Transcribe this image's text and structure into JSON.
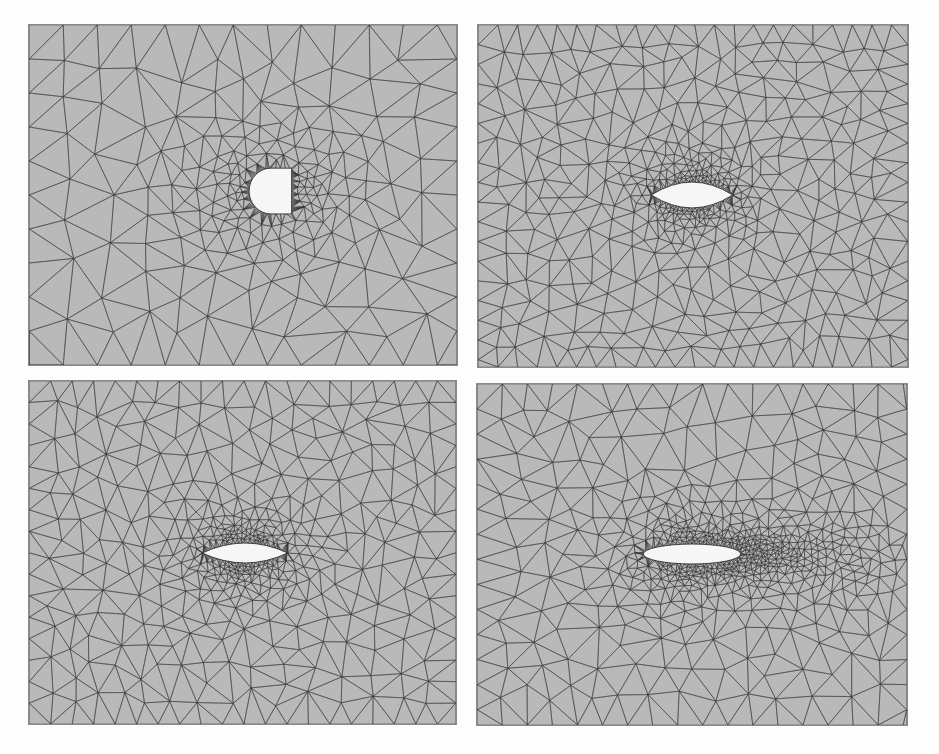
{
  "figure": {
    "background": "#fdfdfd",
    "mesh_fill": "#b9b9b9",
    "edge_color": "#3a3a3a",
    "obstacle_fill": "#f6f6f6",
    "panels": [
      {
        "id": "top-left",
        "obstacle": "d-shape",
        "x": 28,
        "y": 24,
        "w": 430,
        "h": 342,
        "cx": 243,
        "cy": 167,
        "ow": 44,
        "oh": 46,
        "coarse": 38,
        "refine": "radial"
      },
      {
        "id": "top-right",
        "obstacle": "airfoil",
        "x": 477,
        "y": 24,
        "w": 432,
        "h": 344,
        "cx": 215,
        "cy": 171,
        "ow": 82,
        "oh": 26,
        "coarse": 22,
        "refine": "radial"
      },
      {
        "id": "bottom-left",
        "obstacle": "airfoil",
        "x": 28,
        "y": 380,
        "w": 429,
        "h": 345,
        "cx": 217,
        "cy": 173,
        "ow": 86,
        "oh": 20,
        "coarse": 24,
        "refine": "radial"
      },
      {
        "id": "bottom-right",
        "obstacle": "ellipse",
        "x": 476,
        "y": 383,
        "w": 432,
        "h": 343,
        "cx": 216,
        "cy": 171,
        "ow": 98,
        "oh": 20,
        "coarse": 28,
        "refine": "wake"
      }
    ]
  }
}
